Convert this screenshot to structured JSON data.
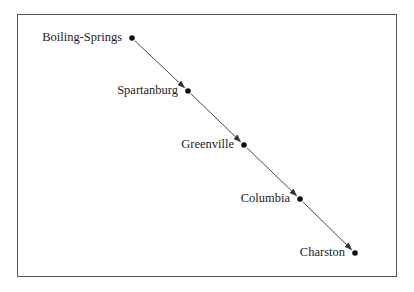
{
  "diagram": {
    "type": "directed-chain",
    "nodes": [
      {
        "id": "boiling-springs",
        "label": "Boiling-Springs",
        "x": 132,
        "y": 38
      },
      {
        "id": "spartanburg",
        "label": "Spartanburg",
        "x": 188,
        "y": 91
      },
      {
        "id": "greenville",
        "label": "Greenville",
        "x": 244,
        "y": 145
      },
      {
        "id": "columbia",
        "label": "Columbia",
        "x": 300,
        "y": 199
      },
      {
        "id": "charston",
        "label": "Charston",
        "x": 355,
        "y": 253
      }
    ],
    "edges": [
      {
        "from": "boiling-springs",
        "to": "spartanburg"
      },
      {
        "from": "spartanburg",
        "to": "greenville"
      },
      {
        "from": "greenville",
        "to": "columbia"
      },
      {
        "from": "columbia",
        "to": "charston"
      }
    ],
    "colors": {
      "node": "#111111",
      "edge": "#333333",
      "border": "#555555"
    }
  }
}
